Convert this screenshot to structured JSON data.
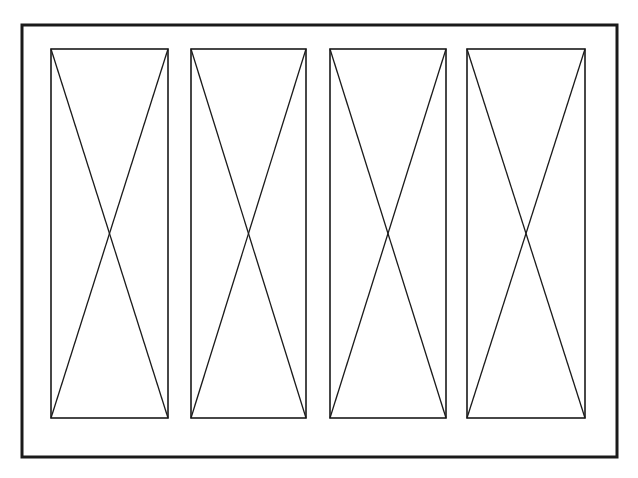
{
  "figure": {
    "background": "#ffffff",
    "stroke_color": "#1a1a1a",
    "outer_frame": {
      "x": 22,
      "y": 25,
      "width": 595,
      "height": 432,
      "stroke_width": 3
    },
    "panels": [
      {
        "x": 51,
        "y": 49,
        "width": 117,
        "height": 369
      },
      {
        "x": 191,
        "y": 49,
        "width": 115,
        "height": 369
      },
      {
        "x": 330,
        "y": 49,
        "width": 116,
        "height": 369
      },
      {
        "x": 467,
        "y": 49,
        "width": 118,
        "height": 369
      }
    ],
    "panel_stroke_width": 1.6,
    "diagonal_stroke_width": 1.3
  }
}
